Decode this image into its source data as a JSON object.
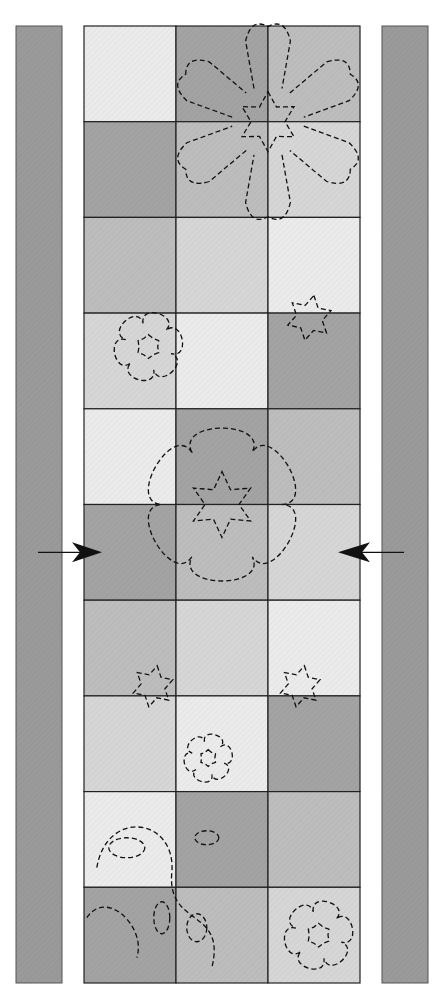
{
  "diagram": {
    "grid": {
      "rows": 10,
      "cols": 3
    },
    "shades": {
      "light": "#ebebeb",
      "light_medium": "#d6d6d6",
      "medium": "#bdbdbd",
      "dark": "#a3a3a3"
    },
    "cells": [
      [
        "light",
        "dark",
        "medium"
      ],
      [
        "dark",
        "medium",
        "light_medium"
      ],
      [
        "medium",
        "light_medium",
        "light"
      ],
      [
        "light_medium",
        "light",
        "dark"
      ],
      [
        "light",
        "dark",
        "medium"
      ],
      [
        "dark",
        "medium",
        "light_medium"
      ],
      [
        "medium",
        "light_medium",
        "light"
      ],
      [
        "light_medium",
        "light",
        "dark"
      ],
      [
        "light",
        "dark",
        "medium"
      ],
      [
        "dark",
        "medium",
        "light_medium"
      ]
    ],
    "border_strip_color": "#9a9a9a",
    "outline_color": "#222222",
    "motifs": [
      {
        "type": "snowflake-large",
        "row": 1.0,
        "col": 2.0,
        "scale": 1.0
      },
      {
        "type": "flower",
        "row": 3.35,
        "col": 0.7,
        "scale": 0.85
      },
      {
        "type": "snowflake-small",
        "row": 3.05,
        "col": 2.45,
        "scale": 0.6
      },
      {
        "type": "snowflake-medallion",
        "row": 5.0,
        "col": 1.5,
        "scale": 1.25
      },
      {
        "type": "snowflake-small",
        "row": 6.9,
        "col": 0.75,
        "scale": 0.55
      },
      {
        "type": "snowflake-small",
        "row": 6.9,
        "col": 2.35,
        "scale": 0.55
      },
      {
        "type": "flower",
        "row": 7.65,
        "col": 1.35,
        "scale": 0.6
      },
      {
        "type": "vine",
        "row": 8.9,
        "col": 0.9,
        "scale": 1.0
      },
      {
        "type": "flower",
        "row": 9.5,
        "col": 2.55,
        "scale": 0.85
      }
    ],
    "arrows": [
      {
        "name": "left-arrow",
        "direction": "right",
        "row": 5.5
      },
      {
        "name": "right-arrow",
        "direction": "left",
        "row": 5.5
      }
    ]
  }
}
